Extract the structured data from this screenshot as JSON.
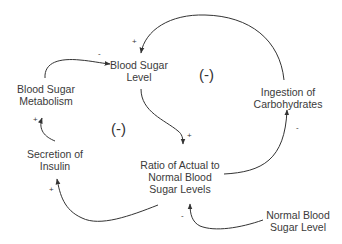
{
  "diagram": {
    "type": "causal-loop",
    "nodes": [
      {
        "id": "bsl",
        "lines": [
          "Blood Sugar",
          "Level"
        ]
      },
      {
        "id": "bsm",
        "lines": [
          "Blood Sugar",
          "Metabolism"
        ]
      },
      {
        "id": "ioc",
        "lines": [
          "Ingestion of",
          "Carbohydrates"
        ]
      },
      {
        "id": "soi",
        "lines": [
          "Secretion of",
          "Insulin"
        ]
      },
      {
        "id": "ratio",
        "lines": [
          "Ratio of Actual to",
          "Normal Blood",
          "Sugar Levels"
        ]
      },
      {
        "id": "nbsl",
        "lines": [
          "Normal Blood",
          "Sugar Level"
        ]
      }
    ],
    "loops": [
      {
        "id": "loop-right",
        "label": "(-)"
      },
      {
        "id": "loop-left",
        "label": "(-)"
      }
    ],
    "links": [
      {
        "from": "bsm",
        "to": "bsl",
        "polarity": "-"
      },
      {
        "from": "ioc",
        "to": "bsl",
        "polarity": "+"
      },
      {
        "from": "bsl",
        "to": "ratio",
        "polarity": "+"
      },
      {
        "from": "ratio",
        "to": "ioc",
        "polarity": "-"
      },
      {
        "from": "soi",
        "to": "bsm",
        "polarity": "+"
      },
      {
        "from": "ratio",
        "to": "soi",
        "polarity": "+"
      },
      {
        "from": "nbsl",
        "to": "ratio",
        "polarity": "-"
      }
    ],
    "colors": {
      "line": "#333333",
      "text": "#3a3a3a",
      "background": "#ffffff"
    }
  }
}
